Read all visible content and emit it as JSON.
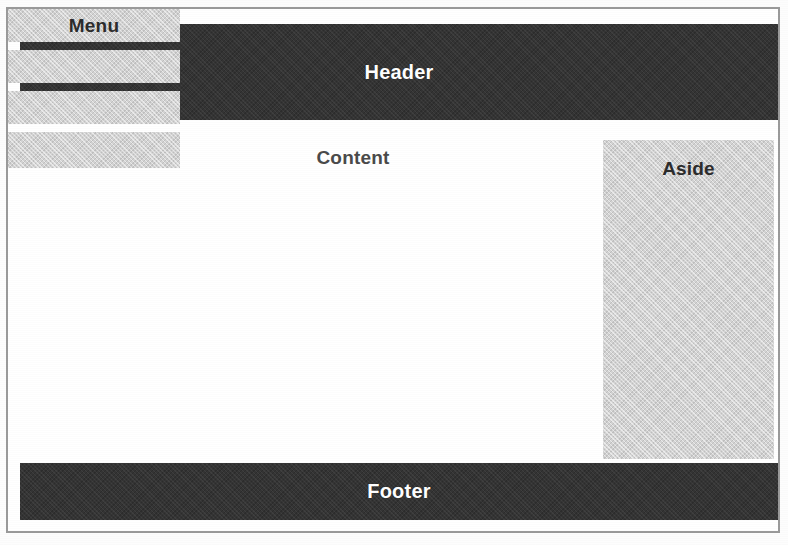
{
  "diagram": {
    "style": "scanned halftone wireframe",
    "colors": {
      "band_dark": "#343434",
      "block_light": "#d3d3d3",
      "page_background": "#ffffff",
      "frame_border": "#9a9a9a",
      "band_text": "#ffffff",
      "block_text": "#2c2c2c",
      "content_text": "#4a4a4a"
    }
  },
  "regions": {
    "header": {
      "label": "Header"
    },
    "footer": {
      "label": "Footer"
    },
    "content": {
      "label": "Content"
    },
    "aside": {
      "label": "Aside"
    },
    "menu": {
      "label": "Menu",
      "items": [
        {
          "label": "Menu"
        },
        {
          "label": ""
        },
        {
          "label": ""
        },
        {
          "label": ""
        }
      ]
    }
  }
}
